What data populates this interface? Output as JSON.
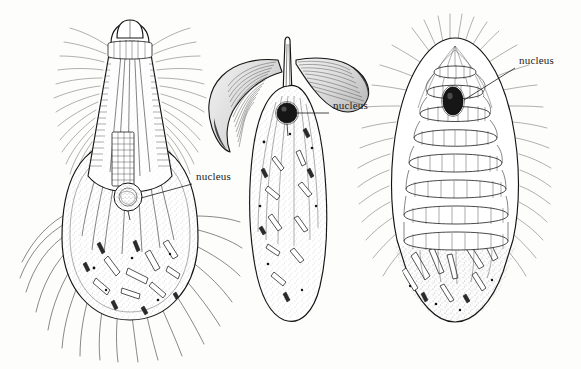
{
  "figure": {
    "medium": "pen-and-ink scientific illustration",
    "background_color": "#fdfdfc",
    "ink_color": "#111111",
    "width": 581,
    "height": 369
  },
  "labels": [
    {
      "id": "label-nucleus-left",
      "text": "nucleus",
      "text_x": 196,
      "text_y": 177,
      "leader": {
        "x1": 192,
        "y1": 184,
        "x2": 141,
        "y2": 198
      },
      "points_to": "organism-left-nucleus"
    },
    {
      "id": "label-nucleus-middle",
      "text": "nucleus",
      "text_x": 333,
      "text_y": 106,
      "leader": {
        "x1": 329,
        "y1": 113,
        "x2": 297,
        "y2": 113
      },
      "points_to": "organism-middle-nucleus"
    },
    {
      "id": "label-nucleus-right",
      "text": "nucleus",
      "text_x": 519,
      "text_y": 61,
      "leader": {
        "x1": 515,
        "y1": 68,
        "x2": 464,
        "y2": 100
      },
      "points_to": "organism-right-nucleus"
    }
  ],
  "organisms": [
    {
      "id": "organism-left",
      "name": "ciliate-pear-shaped-cell",
      "description": "Elongated conical anterior with dense lateral cilia and a rounded bulbous posterior containing rod-shaped inclusions",
      "center_x": 130,
      "center_y": 185,
      "nucleus": {
        "cx": 128,
        "cy": 197,
        "rx": 14,
        "ry": 14,
        "style": "open-stippled"
      }
    },
    {
      "id": "organism-middle",
      "name": "ciliate-leaf-shaped-cell",
      "description": "Slender leaf-shaped body with two large curved wing-like membranelles at the anterior end",
      "center_x": 288,
      "center_y": 180,
      "nucleus": {
        "cx": 287,
        "cy": 113,
        "rx": 9,
        "ry": 10,
        "style": "dark-filled"
      }
    },
    {
      "id": "organism-right",
      "name": "ciliate-spiral-banded-cell",
      "description": "Broad ovate body fringed with cilia, crossed by a descending spiral band of ciliary rows",
      "center_x": 455,
      "center_y": 185,
      "nucleus": {
        "cx": 453,
        "cy": 101,
        "rx": 10,
        "ry": 14,
        "style": "dark-filled"
      }
    }
  ]
}
